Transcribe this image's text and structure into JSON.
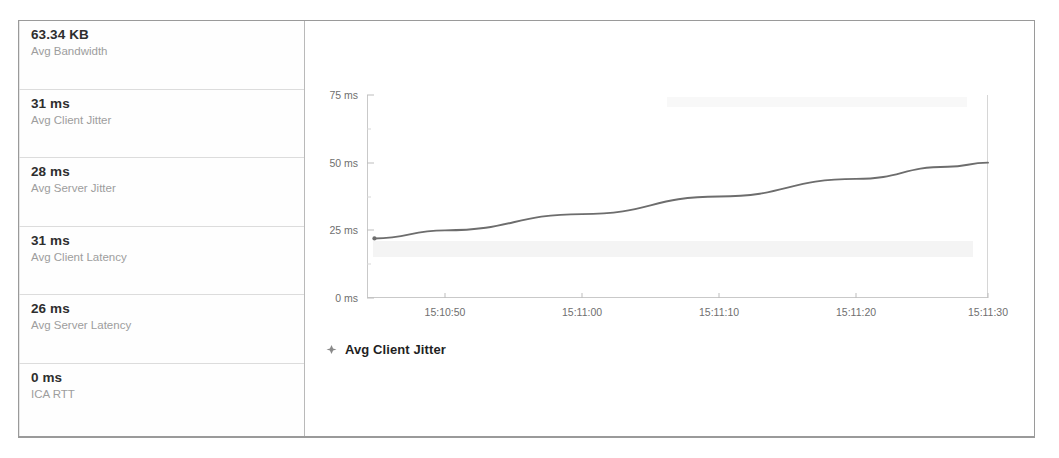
{
  "sidebar": {
    "metrics": [
      {
        "value": "63.34 KB",
        "label": "Avg Bandwidth"
      },
      {
        "value": "31 ms",
        "label": "Avg Client Jitter"
      },
      {
        "value": "28 ms",
        "label": "Avg Server Jitter"
      },
      {
        "value": "31 ms",
        "label": "Avg Client Latency"
      },
      {
        "value": "26 ms",
        "label": "Avg Server Latency"
      },
      {
        "value": "0 ms",
        "label": "ICA RTT"
      }
    ]
  },
  "legend": {
    "marker_icon": "diamond-marker-icon",
    "label": "Avg Client Jitter"
  },
  "colors": {
    "series_line": "#6d6d6d",
    "axis": "#c9c9c9",
    "tick_text": "#6f6f6f",
    "metric_value": "#2e2e2e",
    "metric_label": "#9d9d9d",
    "panel_border": "#9a9a9a"
  },
  "chart_data": {
    "type": "line",
    "title": "",
    "xlabel": "",
    "ylabel": "",
    "legend_position": "bottom-left",
    "grid": false,
    "ylim": [
      0,
      75
    ],
    "y_ticks": [
      0,
      25,
      50,
      75
    ],
    "y_tick_labels": [
      "0 ms",
      "25 ms",
      "50 ms",
      "75 ms"
    ],
    "y_unit": "ms",
    "x_ticks": [
      "15:10:50",
      "15:11:00",
      "15:11:10",
      "15:11:20",
      "15:11:30"
    ],
    "x_tick_positions": [
      0.1256,
      0.3463,
      0.5669,
      0.7875,
      1.0
    ],
    "series": [
      {
        "name": "Avg Client Jitter",
        "color": "#6d6d6d",
        "marker": "diamond",
        "x": [
          0.012,
          0.1256,
          0.3463,
          0.5669,
          0.7875,
          0.935,
          1.0
        ],
        "values": [
          22,
          25,
          31,
          37.5,
          44,
          48.5,
          50
        ]
      }
    ]
  }
}
